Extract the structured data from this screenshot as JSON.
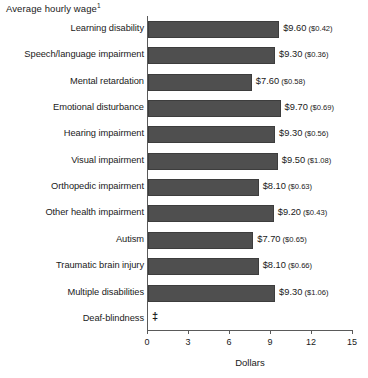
{
  "chart_data": {
    "type": "bar",
    "orientation": "horizontal",
    "title": "Average hourly wage",
    "title_footnote": "1",
    "xlabel": "Dollars",
    "ylabel": "",
    "xlim": [
      0,
      15
    ],
    "xticks": [
      0,
      3,
      6,
      9,
      12,
      15
    ],
    "xtick_labels": [
      "0",
      "3",
      "6",
      "9",
      "12",
      "15"
    ],
    "grid": false,
    "legend": null,
    "bar_color": "#4f4f4f",
    "axis_color": "#5a5a5a",
    "categories": [
      "Learning disability",
      "Speech/language impairment",
      "Mental retardation",
      "Emotional disturbance",
      "Hearing impairment",
      "Visual impairment",
      "Orthopedic impairment",
      "Other health impairment",
      "Autism",
      "Traumatic brain injury",
      "Multiple disabilities",
      "Deaf-blindness"
    ],
    "values": [
      9.6,
      9.3,
      7.6,
      9.7,
      9.3,
      9.5,
      8.1,
      9.2,
      7.7,
      8.1,
      9.3,
      null
    ],
    "standard_errors": [
      0.42,
      0.36,
      0.58,
      0.69,
      0.56,
      1.08,
      0.63,
      0.43,
      0.65,
      0.66,
      1.06,
      null
    ],
    "data_labels": [
      "$9.60",
      "$9.30",
      "$7.60",
      "$9.70",
      "$9.30",
      "$9.50",
      "$8.10",
      "$9.20",
      "$7.70",
      "$8.10",
      "$9.30",
      "‡"
    ],
    "se_labels": [
      "($0.42)",
      "($0.36)",
      "($0.58)",
      "($0.69)",
      "($0.56)",
      "($1.08)",
      "($0.63)",
      "($0.43)",
      "($0.65)",
      "($0.66)",
      "($1.06)",
      ""
    ],
    "suppressed_marker": "‡"
  }
}
